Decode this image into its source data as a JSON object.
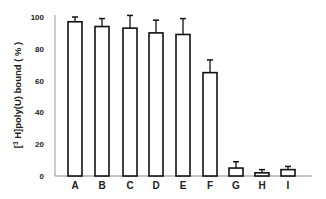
{
  "chart_data": {
    "type": "bar",
    "title": "",
    "xlabel": "",
    "ylabel": "[3H]poly(U) bound ( % )",
    "ylabel_parts": {
      "open": "[",
      "sup": "3",
      "main": " H]poly(U) bound  ( % )"
    },
    "ylim": [
      0,
      100
    ],
    "yticks": [
      0,
      20,
      40,
      60,
      80,
      100
    ],
    "grid": false,
    "legend": null,
    "categories": [
      "A",
      "B",
      "C",
      "D",
      "E",
      "F",
      "G",
      "H",
      "I"
    ],
    "values": [
      97,
      94,
      93,
      90,
      89,
      65,
      5,
      2,
      4
    ],
    "error": [
      3,
      5,
      8,
      8,
      10,
      8,
      4,
      2,
      2
    ],
    "bar_fill": "#ffffff",
    "bar_stroke": "#111111"
  }
}
